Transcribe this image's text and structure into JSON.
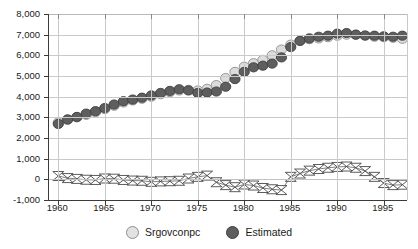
{
  "chart_data": {
    "type": "scatter",
    "title": "",
    "subtitle": "",
    "xlabel": "",
    "ylabel": "",
    "xlim": [
      1959,
      1997.5
    ],
    "ylim": [
      -1000,
      8000
    ],
    "grid": true,
    "legend_position": "bottom-center",
    "y_ticks": [
      8000,
      7000,
      6000,
      5000,
      4000,
      3000,
      2000,
      1000,
      0,
      -1000
    ],
    "y_tick_labels": [
      "8,000",
      "7,000",
      "6,000",
      "5,000",
      "4,000",
      "3,000",
      "2,000",
      "1,000",
      "0",
      "-1,000"
    ],
    "x_ticks": [
      1960,
      1965,
      1970,
      1975,
      1980,
      1985,
      1990,
      1995
    ],
    "x_tick_labels": [
      "1960",
      "1965",
      "1970",
      "1975",
      "1980",
      "1985",
      "1990",
      "1995"
    ],
    "x": [
      1960,
      1961,
      1962,
      1963,
      1964,
      1965,
      1966,
      1967,
      1968,
      1969,
      1970,
      1971,
      1972,
      1973,
      1974,
      1975,
      1976,
      1977,
      1978,
      1979,
      1980,
      1981,
      1982,
      1983,
      1984,
      1985,
      1986,
      1987,
      1988,
      1989,
      1990,
      1991,
      1992,
      1993,
      1994,
      1995,
      1996,
      1997
    ],
    "series": [
      {
        "name": "Srgovconpc",
        "marker": "circle-light",
        "color": "#dcdcdc",
        "edge_color": "#8e8e8e",
        "values": [
          2750,
          2880,
          3000,
          3120,
          3250,
          3400,
          3560,
          3720,
          3820,
          3900,
          4000,
          4120,
          4220,
          4300,
          4330,
          4300,
          4380,
          4560,
          4900,
          5200,
          5450,
          5620,
          5780,
          6000,
          6280,
          6520,
          6700,
          6780,
          6820,
          6880,
          6950,
          7000,
          7000,
          6950,
          6900,
          6880,
          6850,
          6800
        ]
      },
      {
        "name": "Estimated",
        "marker": "circle-dark",
        "color": "#5e5e5e",
        "edge_color": "#3f3f3f",
        "values": [
          2680,
          2900,
          3020,
          3180,
          3300,
          3450,
          3620,
          3780,
          3860,
          3950,
          4060,
          4180,
          4280,
          4360,
          4300,
          4180,
          4200,
          4250,
          4480,
          4850,
          5200,
          5420,
          5500,
          5600,
          5900,
          6400,
          6700,
          6820,
          6900,
          6950,
          7050,
          7080,
          7000,
          6960,
          6950,
          6920,
          6900,
          6950
        ]
      },
      {
        "name": "Residual",
        "marker": "bowtie",
        "color": "#ffffff",
        "edge_color": "#4a4a4a",
        "values": [
          160,
          60,
          20,
          -20,
          -30,
          40,
          30,
          -30,
          -60,
          -70,
          -120,
          -100,
          -90,
          -70,
          40,
          120,
          180,
          -140,
          -280,
          -380,
          -250,
          -300,
          -420,
          -480,
          -520,
          120,
          280,
          420,
          500,
          560,
          600,
          620,
          560,
          400,
          120,
          -180,
          -280,
          -260
        ]
      }
    ]
  },
  "legend": {
    "items": [
      {
        "label": "Srgovconpc",
        "marker": "circle-light"
      },
      {
        "label": "Estimated",
        "marker": "circle-dark"
      }
    ]
  },
  "colors": {
    "light_series": "#dcdcdc",
    "dark_series": "#5e5e5e",
    "grid": "#c9c9c9",
    "axis": "#3a3a3a",
    "background": "#ffffff",
    "text": "#1a1a1a"
  }
}
